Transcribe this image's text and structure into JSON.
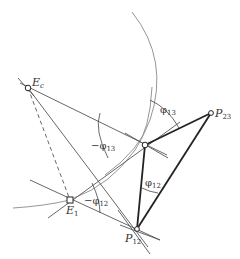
{
  "diagram": {
    "points": {
      "Ec": {
        "label": "E",
        "sub": "c",
        "x": 28,
        "y": 88
      },
      "E1": {
        "label": "E",
        "sub": "1",
        "x": 70,
        "y": 200
      },
      "P13": {
        "x": 145,
        "y": 145
      },
      "P23": {
        "label": "P",
        "sub": "23",
        "x": 211,
        "y": 113
      },
      "P12": {
        "label": "P",
        "sub": "12",
        "x": 137,
        "y": 229
      }
    },
    "angles": {
      "phi13_top": {
        "prefix": "",
        "sym": "φ",
        "sub": "13"
      },
      "phi13_neg": {
        "prefix": "−",
        "sym": "φ",
        "sub": "13"
      },
      "phi12_neg": {
        "prefix": "−",
        "sym": "φ",
        "sub": "12"
      },
      "phi12": {
        "prefix": "",
        "sym": "φ",
        "sub": "12"
      }
    },
    "colors": {
      "thin_line": "#555555",
      "thick_line": "#222222",
      "arc": "#888888"
    }
  }
}
